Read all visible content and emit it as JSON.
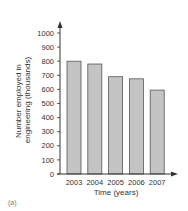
{
  "chart_data": {
    "type": "bar",
    "title": "",
    "categories": [
      "2003",
      "2004",
      "2005",
      "2006",
      "2007"
    ],
    "values": [
      800,
      780,
      690,
      675,
      595
    ],
    "xlabel": "Time (years)",
    "ylabel": "Number employed in engineering (thousands)",
    "ylabel_lines": [
      "Number employed in",
      "engineering (thousands)"
    ],
    "ylim": [
      0,
      1000
    ],
    "yticks": [
      0,
      100,
      200,
      300,
      400,
      500,
      600,
      700,
      800,
      900,
      1000
    ],
    "grid": false,
    "legend": null,
    "bar_color": "#c4c4c4",
    "bar_edge_color": "#555555"
  },
  "caption": "(a)"
}
